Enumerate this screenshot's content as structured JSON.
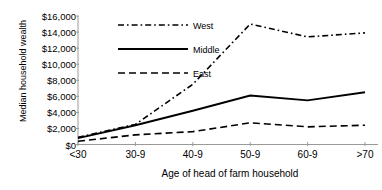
{
  "chart_data": {
    "type": "line",
    "title": "",
    "xlabel": "Age of head of farm household",
    "ylabel": "Median household wealth",
    "categories": [
      "<30",
      "30-9",
      "40-9",
      "50-9",
      "60-9",
      ">70"
    ],
    "ylim": [
      0,
      16000
    ],
    "ytick_labels": [
      "$16,000",
      "$14,000",
      "$12,000",
      "$10,000",
      "$8,000",
      "$6,000",
      "$4,000",
      "$2,000",
      "$0"
    ],
    "ytick_values": [
      16000,
      14000,
      12000,
      10000,
      8000,
      6000,
      4000,
      2000,
      0
    ],
    "grid": false,
    "legend_position": "top-center",
    "series": [
      {
        "name": "West",
        "style": "dash-dot",
        "color": "#000000",
        "values": [
          900,
          2500,
          7500,
          15000,
          13400,
          13900
        ]
      },
      {
        "name": "Middle",
        "style": "solid",
        "color": "#000000",
        "values": [
          800,
          2400,
          4200,
          6100,
          5500,
          6500
        ]
      },
      {
        "name": "East",
        "style": "dashed",
        "color": "#000000",
        "values": [
          400,
          1200,
          1600,
          2700,
          2200,
          2400
        ]
      }
    ]
  },
  "legend": {
    "items": [
      {
        "label": "West"
      },
      {
        "label": "Middle"
      },
      {
        "label": "East"
      }
    ]
  },
  "axis": {
    "axis_color": "#9a9a9a",
    "tick_color": "#9a9a9a"
  }
}
